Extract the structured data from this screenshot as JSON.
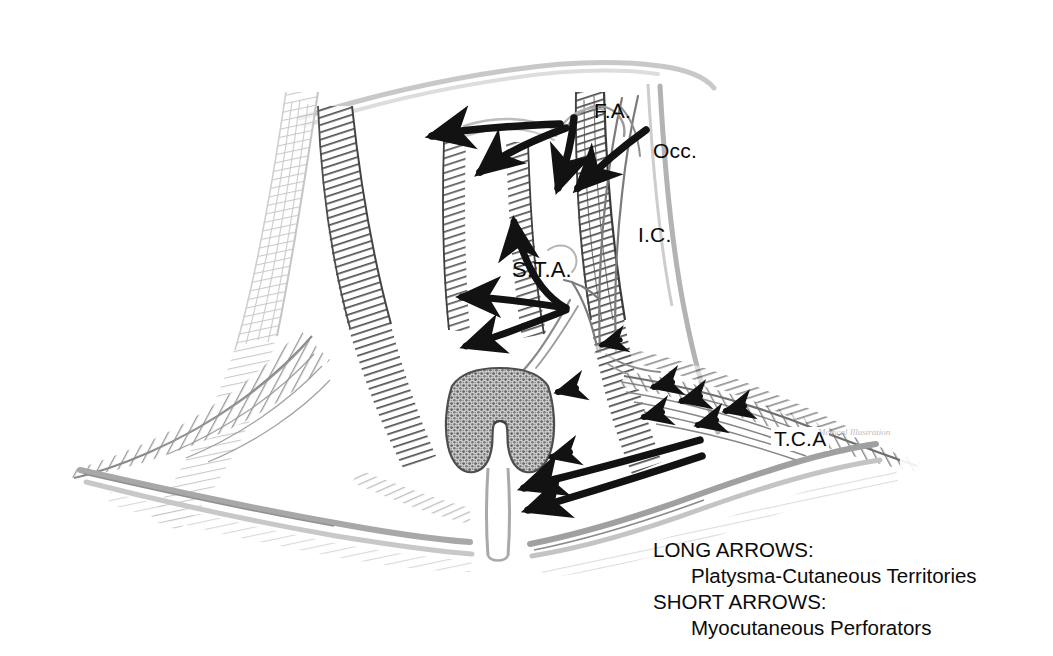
{
  "figure": {
    "kind": "anatomical-illustration",
    "background_color": "#ffffff",
    "ink_color": "#111111",
    "pencil_color": "#8d8d8d",
    "width": 1053,
    "height": 656
  },
  "labels": {
    "facial_artery": "F.A.",
    "occipital_artery": "Occ.",
    "internal_carotid": "I.C.",
    "superior_thyroid_artery": "S.T.A.",
    "transverse_cervical_artery": "T.C.A"
  },
  "legend": {
    "long_arrows_heading": "LONG ARROWS:",
    "long_arrows_desc": "Platysma-Cutaneous Territories",
    "short_arrows_heading": "SHORT ARROWS:",
    "short_arrows_desc": "Myocutaneous Perforators"
  },
  "signature": {
    "text": "Medical Illustration"
  },
  "structures": [
    {
      "name": "sternocleidomastoid-left",
      "shading": "dark-graphite"
    },
    {
      "name": "sternocleidomastoid-right",
      "shading": "dark-graphite"
    },
    {
      "name": "trapezius-left",
      "shading": "mid-graphite"
    },
    {
      "name": "trapezius-right",
      "shading": "mid-graphite"
    },
    {
      "name": "clavicle-left",
      "shading": "light-outline"
    },
    {
      "name": "clavicle-right",
      "shading": "light-outline"
    },
    {
      "name": "thyroid-gland",
      "shading": "stippled"
    },
    {
      "name": "trachea",
      "shading": "light-outline"
    },
    {
      "name": "carotid-sheath",
      "shading": "line-drawing"
    },
    {
      "name": "mandible-margin",
      "shading": "light-outline"
    }
  ],
  "arrows": {
    "long_count": 8,
    "short_count": 8,
    "long_meaning": "Platysma-Cutaneous Territories",
    "short_meaning": "Myocutaneous Perforators"
  }
}
